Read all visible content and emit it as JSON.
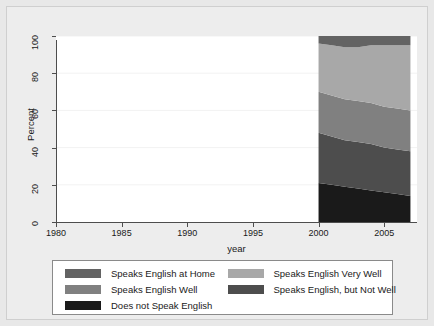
{
  "chart_data": {
    "type": "area",
    "title": "",
    "subtitle": "",
    "xlabel": "year",
    "ylabel": "Percent",
    "xlim": [
      1980,
      2007.5
    ],
    "ylim": [
      0,
      100
    ],
    "xticks": [
      1980,
      1985,
      1990,
      1995,
      2000,
      2005
    ],
    "yticks": [
      0,
      20,
      40,
      60,
      80,
      100
    ],
    "grid": true,
    "stacked": true,
    "legend_position": "bottom",
    "x": [
      2000,
      2001,
      2002,
      2003,
      2004,
      2005,
      2006,
      2007
    ],
    "series": [
      {
        "name": "Does not Speak English",
        "color": "#1a1a1a",
        "values": [
          21,
          20,
          19,
          18,
          17,
          16,
          15,
          14
        ]
      },
      {
        "name": "Speaks English, but Not Well",
        "color": "#4d4d4d",
        "values": [
          27,
          26,
          25,
          25,
          25,
          24,
          24,
          24
        ]
      },
      {
        "name": "Speaks English Well",
        "color": "#808080",
        "values": [
          22,
          22,
          22,
          22,
          22,
          22,
          22,
          22
        ]
      },
      {
        "name": "Speaks English Very Well",
        "color": "#a8a8a8",
        "values": [
          26,
          27,
          28,
          29,
          31,
          33,
          34,
          35
        ]
      },
      {
        "name": "Speaks English at Home",
        "color": "#636363",
        "values": [
          4,
          5,
          6,
          6,
          5,
          5,
          5,
          5
        ]
      }
    ],
    "cumulative_top_boundaries": {
      "does_not_speak_english": [
        21,
        20,
        19,
        18,
        17,
        16,
        15,
        14
      ],
      "speaks_english_but_not_well": [
        48,
        46,
        44,
        43,
        42,
        40,
        39,
        38
      ],
      "speaks_english_well": [
        70,
        68,
        66,
        65,
        64,
        62,
        61,
        60
      ],
      "speaks_english_very_well": [
        96,
        95,
        94,
        94,
        95,
        95,
        95,
        95
      ],
      "speaks_english_at_home": [
        100,
        100,
        100,
        100,
        100,
        100,
        100,
        100
      ]
    }
  },
  "axes": {
    "y_title": "Percent",
    "x_title": "year",
    "y_tick_labels": [
      "0",
      "20",
      "40",
      "60",
      "80",
      "100"
    ],
    "x_tick_labels": [
      "1980",
      "1985",
      "1990",
      "1995",
      "2000",
      "2005"
    ]
  },
  "legend": {
    "entries": [
      {
        "label": "Speaks English at Home",
        "color": "#636363"
      },
      {
        "label": "Speaks English Very Well",
        "color": "#a8a8a8"
      },
      {
        "label": "Speaks English Well",
        "color": "#808080"
      },
      {
        "label": "Speaks English, but Not Well",
        "color": "#4d4d4d"
      },
      {
        "label": "Does not Speak English",
        "color": "#1a1a1a"
      }
    ]
  },
  "style": {
    "page_background": "#e8e8e8",
    "figure_background": "#ededed",
    "plot_background": "#ffffff",
    "axis_color": "#4d4d4d",
    "grid_color": "#f2f2f2",
    "text_color": "#1a1a1a"
  }
}
